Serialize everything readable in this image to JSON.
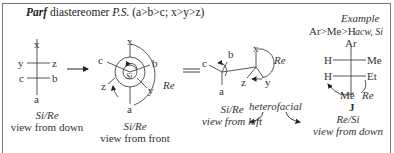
{
  "title": {
    "prefix": "Parf",
    "main": " diastereomer ",
    "ps": "P.S.",
    "priority": " (a>b>c;  x>y>z)"
  },
  "panels": [
    {
      "id": "fischer",
      "atoms": {
        "top": "x",
        "left1": "y",
        "right1": "z",
        "left2": "c",
        "right2": "b",
        "bottom": "a"
      },
      "caption_italic": "Si/Re",
      "caption": "view from down"
    },
    {
      "id": "newman",
      "atoms": {
        "top": "x",
        "c": "c",
        "b": "b",
        "z": "z",
        "y": "y",
        "bottom": "a",
        "center": "Si",
        "arc": "Re"
      },
      "caption_italic": "Si/Re",
      "caption": "view from front"
    },
    {
      "id": "sawhorse",
      "atoms": {
        "c": "c",
        "b": "b",
        "a": "a",
        "x": "x",
        "z": "z",
        "y": "y",
        "arc": "Re"
      },
      "caption_italic": "Si/Re",
      "caption": "view from left"
    }
  ],
  "heterofacial": "heterofacial",
  "example": {
    "heading": "Example",
    "priority": "Ar>Me>H",
    "rotation": "acw, Si",
    "atoms": {
      "top": "Ar",
      "left1": "H",
      "right1": "Me",
      "left2": "H",
      "right2": "Et",
      "bottom": "Me",
      "arc": "Re"
    },
    "compound_label": "J",
    "caption_italic": "Re/Si",
    "caption": "view from down"
  },
  "symbols": {
    "arrow": "right-arrow",
    "equals": "double-line-equals"
  }
}
